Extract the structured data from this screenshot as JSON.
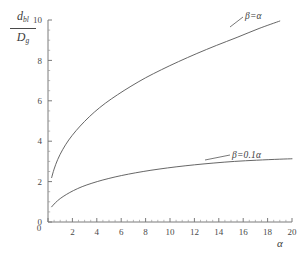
{
  "chart_data": {
    "type": "line",
    "title": "",
    "xlabel": "α",
    "ylabel": "d_bl / D_g",
    "ylabel_numerator": "d",
    "ylabel_numerator_sub": "bl",
    "ylabel_denominator": "D",
    "ylabel_denominator_sub": "g",
    "xlim": [
      0,
      20
    ],
    "ylim": [
      0,
      10
    ],
    "grid": false,
    "legend_position": "inline-right",
    "x_ticks": [
      0,
      2,
      4,
      6,
      8,
      10,
      12,
      14,
      16,
      18,
      20
    ],
    "x_tick_labels": [
      "0",
      "2",
      "4",
      "6",
      "8",
      "10",
      "12",
      "14",
      "16",
      "18",
      "20"
    ],
    "x_minor_step": 0.5,
    "y_ticks": [
      0,
      2,
      4,
      6,
      8,
      10
    ],
    "y_tick_labels": [
      "0",
      "2",
      "4",
      "6",
      "8",
      "10"
    ],
    "y_minor_step": 0.5,
    "series": [
      {
        "name": "β=α",
        "label": "β=α",
        "color": "#555555",
        "x": [
          0.3,
          0.5,
          0.8,
          1.2,
          1.7,
          2.3,
          3.0,
          3.8,
          4.7,
          5.7,
          6.8,
          8.0,
          9.3,
          10.7,
          12.2,
          13.8,
          15.5,
          17.3,
          19.0
        ],
        "y": [
          2.2,
          2.62,
          3.1,
          3.58,
          4.06,
          4.52,
          4.98,
          5.44,
          5.88,
          6.3,
          6.72,
          7.14,
          7.54,
          7.94,
          8.34,
          8.74,
          9.14,
          9.58,
          9.95
        ]
      },
      {
        "name": "β=0.1α",
        "label": "β=0.1α",
        "color": "#555555",
        "x": [
          0.3,
          0.6,
          1.0,
          1.5,
          2.1,
          2.8,
          3.6,
          4.5,
          5.5,
          6.6,
          7.8,
          9.1,
          10.5,
          12.0,
          13.6,
          15.3,
          17.1,
          19.0,
          20.0
        ],
        "y": [
          0.75,
          0.95,
          1.16,
          1.36,
          1.56,
          1.75,
          1.92,
          2.08,
          2.23,
          2.37,
          2.5,
          2.62,
          2.73,
          2.83,
          2.92,
          3.0,
          3.06,
          3.11,
          3.13
        ]
      }
    ],
    "annotations": [
      {
        "name": "upper-curve-label",
        "text": "β=α"
      },
      {
        "name": "lower-curve-label",
        "text": "β=0.1α"
      }
    ]
  }
}
